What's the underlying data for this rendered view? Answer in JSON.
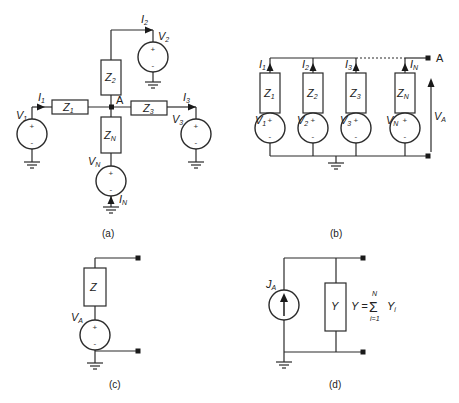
{
  "panels": {
    "a": {
      "caption": "(a)",
      "node": "A",
      "impedances": [
        {
          "main": "Z",
          "sub": "1"
        },
        {
          "main": "Z",
          "sub": "2"
        },
        {
          "main": "Z",
          "sub": "3"
        },
        {
          "main": "Z",
          "sub": "N"
        }
      ],
      "sources": [
        {
          "main": "V",
          "sub": "1"
        },
        {
          "main": "V",
          "sub": "2"
        },
        {
          "main": "V",
          "sub": "3"
        },
        {
          "main": "V",
          "sub": "N"
        }
      ],
      "currents": [
        {
          "main": "I",
          "sub": "1"
        },
        {
          "main": "I",
          "sub": "2"
        },
        {
          "main": "I",
          "sub": "3"
        },
        {
          "main": "I",
          "sub": "N"
        }
      ]
    },
    "b": {
      "caption": "(b)",
      "node": "A",
      "voltage": {
        "main": "V",
        "sub": "A"
      },
      "impedances": [
        {
          "main": "Z",
          "sub": "1"
        },
        {
          "main": "Z",
          "sub": "2"
        },
        {
          "main": "Z",
          "sub": "3"
        },
        {
          "main": "Z",
          "sub": "N"
        }
      ],
      "sources": [
        {
          "main": "V",
          "sub": "1"
        },
        {
          "main": "V",
          "sub": "2"
        },
        {
          "main": "V",
          "sub": "3"
        },
        {
          "main": "V",
          "sub": "N"
        }
      ],
      "currents": [
        {
          "main": "I",
          "sub": "1"
        },
        {
          "main": "I",
          "sub": "2"
        },
        {
          "main": "I",
          "sub": "3"
        },
        {
          "main": "I",
          "sub": "N"
        }
      ]
    },
    "c": {
      "caption": "(c)",
      "impedance": "Z",
      "source": {
        "main": "V",
        "sub": "A"
      }
    },
    "d": {
      "caption": "(d)",
      "current_source": {
        "main": "J",
        "sub": "A"
      },
      "admittance": "Y",
      "formula": {
        "lhs": "Y =",
        "sigma": "Σ",
        "upper": "N",
        "lower": "i=1",
        "term_main": "Y",
        "term_sub": "i"
      }
    }
  },
  "symbols": {
    "plus": "+",
    "minus": "-"
  }
}
